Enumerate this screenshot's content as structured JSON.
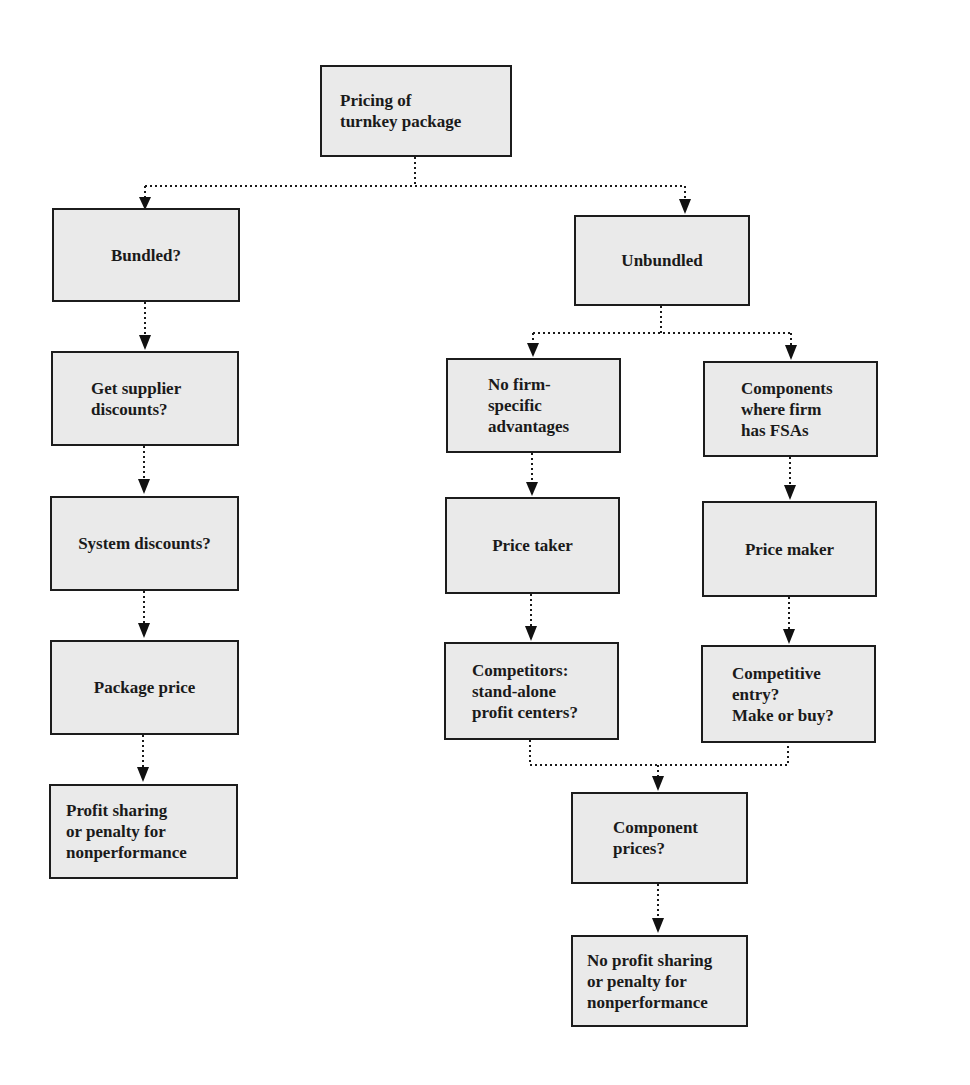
{
  "diagram": {
    "title": "Pricing of turnkey package",
    "colors": {
      "box_fill": "#eaeaea",
      "box_border": "#1c1c1c",
      "text": "#1a1a1a",
      "connector": "#1a1a1a",
      "background": "#ffffff"
    },
    "nodes": {
      "root": "Pricing of\nturnkey package",
      "bundled": "Bundled?",
      "unbundled": "Unbundled",
      "supplier_discounts": "Get supplier\ndiscounts?",
      "system_discounts": "System discounts?",
      "package_price": "Package price",
      "profit_sharing": "Profit sharing\nor penalty for\nnonperformance",
      "no_fsa": "No firm-\nspecific\nadvantages",
      "components_fsa": "Components\nwhere firm\nhas FSAs",
      "price_taker": "Price taker",
      "price_maker": "Price maker",
      "competitors": "Competitors:\nstand-alone\nprofit centers?",
      "competitive_entry": "Competitive\nentry?\nMake or buy?",
      "component_prices": "Component\nprices?",
      "no_profit_sharing": "No profit sharing\nor penalty for\nnonperformance"
    },
    "edges": [
      {
        "from": "root",
        "to": "bundled"
      },
      {
        "from": "root",
        "to": "unbundled"
      },
      {
        "from": "bundled",
        "to": "supplier_discounts"
      },
      {
        "from": "supplier_discounts",
        "to": "system_discounts"
      },
      {
        "from": "system_discounts",
        "to": "package_price"
      },
      {
        "from": "package_price",
        "to": "profit_sharing"
      },
      {
        "from": "unbundled",
        "to": "no_fsa"
      },
      {
        "from": "unbundled",
        "to": "components_fsa"
      },
      {
        "from": "no_fsa",
        "to": "price_taker"
      },
      {
        "from": "components_fsa",
        "to": "price_maker"
      },
      {
        "from": "price_taker",
        "to": "competitors"
      },
      {
        "from": "price_maker",
        "to": "competitive_entry"
      },
      {
        "from": "competitors",
        "to": "component_prices"
      },
      {
        "from": "competitive_entry",
        "to": "component_prices"
      },
      {
        "from": "component_prices",
        "to": "no_profit_sharing"
      }
    ]
  }
}
